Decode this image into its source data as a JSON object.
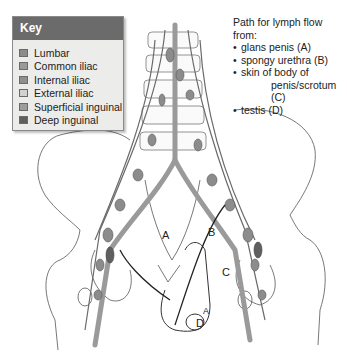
{
  "key": {
    "title": "Key",
    "items": [
      {
        "label": "Lumbar",
        "color": "#8c8c8c"
      },
      {
        "label": "Common iliac",
        "color": "#9a9a9a"
      },
      {
        "label": "Internal iliac",
        "color": "#8f8f8f"
      },
      {
        "label": "External iliac",
        "color": "#d2d2d2"
      },
      {
        "label": "Superficial inguinal",
        "color": "#9d9d9d"
      },
      {
        "label": "Deep inguinal",
        "color": "#5f5f5f"
      }
    ]
  },
  "legend": {
    "title": "Path for lymph flow from:",
    "items": [
      {
        "text": "glans penis (A)"
      },
      {
        "text": "spongy urethra (B)"
      },
      {
        "text": "skin of body of",
        "continuation": "penis/scrotum (C)"
      },
      {
        "text": "testis (D)"
      }
    ]
  },
  "diagram_labels": {
    "A": "A",
    "B": "B",
    "C": "C",
    "D": "D",
    "A_small": "A"
  }
}
